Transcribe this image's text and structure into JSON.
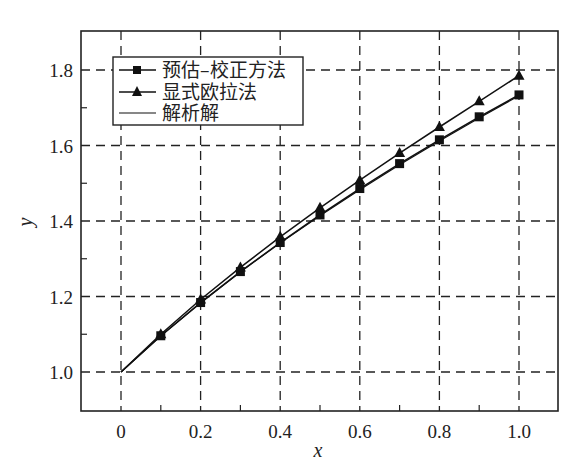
{
  "chart_data": {
    "type": "line",
    "title": "",
    "xlabel": "x",
    "ylabel": "y",
    "xlim": [
      -0.1,
      1.1
    ],
    "ylim": [
      0.9,
      1.9
    ],
    "x_ticks": [
      "0",
      "0.2",
      "0.4",
      "0.6",
      "0.8",
      "1.0"
    ],
    "x_tick_values": [
      0,
      0.2,
      0.4,
      0.6,
      0.8,
      1.0
    ],
    "y_ticks": [
      "1.0",
      "1.2",
      "1.4",
      "1.6",
      "1.8"
    ],
    "y_tick_values": [
      1.0,
      1.2,
      1.4,
      1.6,
      1.8
    ],
    "grid": true,
    "grid_style": "dashed",
    "legend_position": "upper left",
    "x": [
      0,
      0.1,
      0.2,
      0.3,
      0.4,
      0.5,
      0.6,
      0.7,
      0.8,
      0.9,
      1.0
    ],
    "series": [
      {
        "name": "预估–校正方法",
        "marker": "square",
        "values": [
          1.0,
          1.096,
          1.184,
          1.266,
          1.343,
          1.416,
          1.486,
          1.552,
          1.615,
          1.676,
          1.734
        ]
      },
      {
        "name": "显式欧拉法",
        "marker": "triangle",
        "values": [
          1.0,
          1.1,
          1.192,
          1.277,
          1.358,
          1.435,
          1.508,
          1.58,
          1.649,
          1.717,
          1.785
        ]
      },
      {
        "name": "解析解",
        "marker": "none",
        "values": [
          1.0,
          1.095,
          1.183,
          1.265,
          1.342,
          1.414,
          1.483,
          1.549,
          1.612,
          1.673,
          1.732
        ]
      }
    ]
  },
  "legend": {
    "items": [
      {
        "label": "预估–校正方法"
      },
      {
        "label": "显式欧拉法"
      },
      {
        "label": "解析解"
      }
    ]
  },
  "axes": {
    "xlabel": "x",
    "ylabel": "y"
  }
}
